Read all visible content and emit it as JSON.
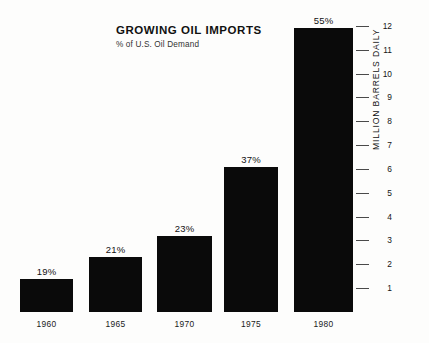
{
  "chart_data": {
    "type": "bar",
    "title": "GROWING OIL IMPORTS",
    "subtitle": "% of U.S. Oil Demand",
    "categories": [
      "1960",
      "1965",
      "1970",
      "1975",
      "1980"
    ],
    "values": [
      1.4,
      2.3,
      3.2,
      6.1,
      11.9
    ],
    "data_labels": [
      "19%",
      "21%",
      "23%",
      "37%",
      "55%"
    ],
    "xlabel": "",
    "ylabel": "MILLION BARRELS DAILY",
    "ylim": [
      0,
      12.6
    ],
    "ytick_labels": [
      "12",
      "11",
      "10",
      "9",
      "8",
      "7",
      "6",
      "5",
      "4",
      "3",
      "2",
      "1"
    ],
    "ytick_values": [
      12,
      11,
      10,
      9,
      8,
      7,
      6,
      5,
      4,
      3,
      2,
      1
    ],
    "axis_position": "right",
    "grid": false,
    "legend": "none",
    "bar_color": "#0a0a0a",
    "background_color": "#fdfdfc"
  }
}
